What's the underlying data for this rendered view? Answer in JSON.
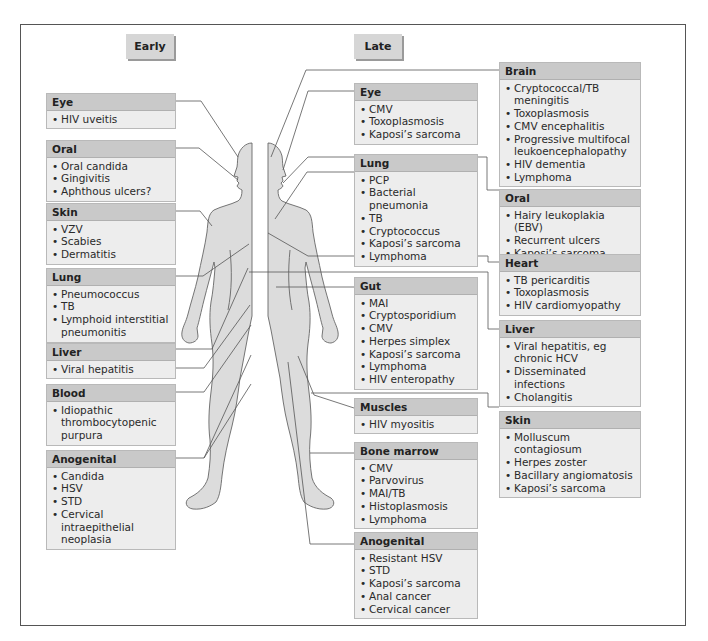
{
  "phases": {
    "early": "Early",
    "late": "Late"
  },
  "early": [
    {
      "title": "Eye",
      "items": [
        "HIV uveitis"
      ]
    },
    {
      "title": "Oral",
      "items": [
        "Oral candida",
        "Gingivitis",
        "Aphthous ulcers?"
      ]
    },
    {
      "title": "Skin",
      "items": [
        "VZV",
        "Scabies",
        "Dermatitis"
      ]
    },
    {
      "title": "Lung",
      "items": [
        "Pneumococcus",
        "TB",
        "Lymphoid interstitial pneumonitis"
      ]
    },
    {
      "title": "Liver",
      "items": [
        "Viral hepatitis"
      ]
    },
    {
      "title": "Blood",
      "items": [
        "Idiopathic thrombocytopenic purpura"
      ]
    },
    {
      "title": "Anogenital",
      "items": [
        "Candida",
        "HSV",
        "STD",
        "Cervical intraepithelial neoplasia"
      ]
    }
  ],
  "late_middle": [
    {
      "title": "Eye",
      "items": [
        "CMV",
        "Toxoplasmosis",
        "Kaposi’s sarcoma"
      ]
    },
    {
      "title": "Lung",
      "items": [
        "PCP",
        "Bacterial pneumonia",
        "TB",
        "Cryptococcus",
        "Kaposi’s sarcoma",
        "Lymphoma"
      ]
    },
    {
      "title": "Gut",
      "items": [
        "MAI",
        "Cryptosporidium",
        "CMV",
        "Herpes simplex",
        "Kaposi’s sarcoma",
        "Lymphoma",
        "HIV enteropathy"
      ]
    },
    {
      "title": "Muscles",
      "items": [
        "HIV myositis"
      ]
    },
    {
      "title": "Bone marrow",
      "items": [
        "CMV",
        "Parvovirus",
        "MAI/TB",
        "Histoplasmosis",
        "Lymphoma"
      ]
    },
    {
      "title": "Anogenital",
      "items": [
        "Resistant HSV",
        "STD",
        "Kaposi’s sarcoma",
        "Anal cancer",
        "Cervical cancer"
      ]
    }
  ],
  "late_right": [
    {
      "title": "Brain",
      "items": [
        "Cryptococcal/TB meningitis",
        "Toxoplasmosis",
        "CMV encephalitis",
        "Progressive multifocal leukoencephalopathy",
        "HIV dementia",
        "Lymphoma"
      ]
    },
    {
      "title": "Oral",
      "items": [
        "Hairy leukoplakia (EBV)",
        "Recurrent ulcers",
        "Kaposi’s sarcoma"
      ]
    },
    {
      "title": "Heart",
      "items": [
        "TB pericarditis",
        "Toxoplasmosis",
        "HIV cardiomyopathy"
      ]
    },
    {
      "title": "Liver",
      "items": [
        "Viral hepatitis, eg chronic HCV",
        "Disseminated infections",
        "Cholangitis"
      ]
    },
    {
      "title": "Skin",
      "items": [
        "Molluscum contagiosum",
        "Herpes zoster",
        "Bacillary angiomatosis",
        "Kaposi’s sarcoma"
      ]
    }
  ],
  "colors": {
    "header": "#c9c9c9",
    "body": "#ededed",
    "figure": "#dcdcdc",
    "line": "#555555"
  }
}
